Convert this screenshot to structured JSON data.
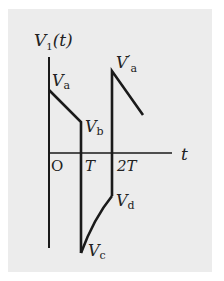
{
  "diagram": {
    "y_axis_label": "V",
    "y_axis_sub": "1",
    "y_axis_arg": "(t)",
    "x_axis_label": "t",
    "origin_label": "O",
    "ticks": [
      "T",
      "2T"
    ],
    "points": {
      "Va": {
        "main": "V",
        "sub": "a"
      },
      "Vb": {
        "main": "V",
        "sub": "b"
      },
      "Vc": {
        "main": "V",
        "sub": "c"
      },
      "Vd": {
        "main": "V",
        "sub": "d"
      },
      "Va_prime": {
        "main": "V",
        "prime": "′",
        "sub": "a"
      }
    }
  },
  "colors": {
    "panel": "#ececec",
    "line": "#1a1a1a"
  }
}
